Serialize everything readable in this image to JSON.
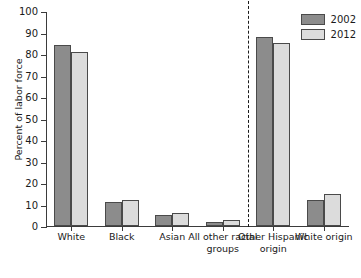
{
  "chart_data": {
    "type": "bar",
    "title": "",
    "xlabel": "",
    "ylabel": "Percent of labor force",
    "ylim": [
      0,
      100
    ],
    "yticks": [
      0,
      10,
      20,
      30,
      40,
      50,
      60,
      70,
      80,
      90,
      100
    ],
    "grid": false,
    "legend_position": "top-right",
    "categories": [
      "White",
      "Black",
      "Asian",
      "All other racial groups",
      "Other Hispanic origin",
      "White origin"
    ],
    "series": [
      {
        "name": "2002",
        "color": "#8c8c8c",
        "values": [
          84,
          11,
          5,
          2,
          88,
          12
        ]
      },
      {
        "name": "2012",
        "color": "#dcdcdc",
        "values": [
          81,
          12,
          6,
          3,
          85,
          15
        ]
      }
    ],
    "annotations": [
      {
        "type": "vertical-dashed-divider",
        "after_category_index": 3
      }
    ]
  },
  "axis": {
    "y_title": "Percent of labor force",
    "y_tick_labels": [
      "100",
      "90",
      "80",
      "70",
      "60",
      "50",
      "40",
      "30",
      "20",
      "10",
      "0"
    ]
  },
  "legend": {
    "items": [
      {
        "label": "2002",
        "swatch": "dark-gray-swatch"
      },
      {
        "label": "2012",
        "swatch": "light-gray-swatch"
      }
    ]
  },
  "colors": {
    "series_2002": "#8c8c8c",
    "series_2012": "#dcdcdc",
    "axis": "#3b3b3b",
    "text": "#1a1a1a",
    "background": "#ffffff"
  }
}
